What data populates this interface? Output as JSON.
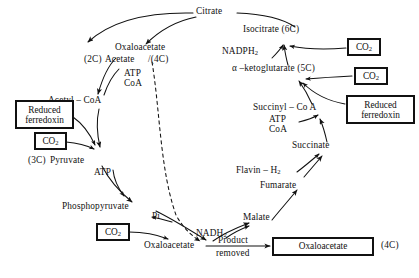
{
  "figure": {
    "stroke_color": "#111111",
    "background_color": "#ffffff"
  },
  "labels": {
    "citrate": "Citrate",
    "isocitrate": "Isocitrate (6C)",
    "nadph2": "NADPH",
    "nadph2_sub": "2",
    "ketoglutarate": "α –ketoglutarate (5C)",
    "succinyl_coa": "Succinyl – Co A",
    "atp_right": "ATP",
    "coa_right": "CoA",
    "succinate": "Succinate",
    "flavin_h2": "Flavin – H",
    "flavin_h2_sub": "2",
    "fumarate": "Fumarate",
    "malate": "Malate",
    "nadh2": "NADH",
    "nadh2_sub": "2",
    "oxaloacetate_bottom": "Oxaloacetate",
    "product_removed_line1": "Product",
    "product_removed_line2": "removed",
    "four_c_bottom": "(4C)",
    "oxaloacetate_top": "Oxaloacetate",
    "four_c_top": "/(4C)",
    "two_c": "(2C)",
    "acetate": "Acetate",
    "atp_left": "ATP",
    "coa_left": "CoA",
    "acetyl_coa": "Acetyl – CoA",
    "three_c": "(3C)",
    "pyruvate": "Pyruvate",
    "atp_pyruvate": "ATP",
    "phosphopyruvate": "Phosphopyruvate",
    "pi": "Pi"
  },
  "boxes": {
    "co2_isocitrate": {
      "text": "CO",
      "sub": "2"
    },
    "co2_ketoglutarate": {
      "text": "CO",
      "sub": "2"
    },
    "co2_pyruvate": {
      "text": "CO",
      "sub": "2"
    },
    "co2_phosphopyruvate": {
      "text": "CO",
      "sub": "2"
    },
    "reduced_ferredoxin_left": {
      "line1": "Reduced",
      "line2": "ferredoxin"
    },
    "reduced_ferredoxin_right": {
      "line1": "Reduced",
      "line2": "ferredoxin"
    },
    "oxaloacetate_product": {
      "text": "Oxaloacetate"
    }
  }
}
